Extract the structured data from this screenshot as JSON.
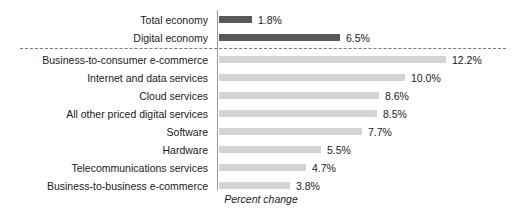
{
  "chart_data": {
    "type": "bar",
    "orientation": "horizontal",
    "title": "",
    "xlabel": "Percent change",
    "ylabel": "",
    "grid": false,
    "legend": null,
    "xlim": [
      0,
      13
    ],
    "value_suffix": "%",
    "categories": [
      "Total economy",
      "Digital economy",
      "Business-to-consumer e-commerce",
      "Internet and data services",
      "Cloud services",
      "All other priced digital services",
      "Software",
      "Hardware",
      "Telecommunications services",
      "Business-to-business e-commerce"
    ],
    "values": [
      1.8,
      6.5,
      12.2,
      10.0,
      8.6,
      8.5,
      7.7,
      5.5,
      4.7,
      3.8
    ],
    "value_labels": [
      "1.8%",
      "6.5%",
      "12.2%",
      "10.0%",
      "8.6%",
      "8.5%",
      "7.7%",
      "5.5%",
      "4.7%",
      "3.8%"
    ],
    "groups": [
      {
        "name": "summary",
        "style": "dark",
        "color": "#595959",
        "categories": [
          "Total economy",
          "Digital economy"
        ]
      },
      {
        "name": "components",
        "style": "light",
        "color": "#d4d4d4",
        "categories": [
          "Business-to-consumer e-commerce",
          "Internet and data services",
          "Cloud services",
          "All other priced digital services",
          "Software",
          "Hardware",
          "Telecommunications services",
          "Business-to-business e-commerce"
        ]
      }
    ],
    "annotations": [
      {
        "type": "dashed-separator",
        "after_category": "Digital economy",
        "color": "#7a7a7a"
      }
    ],
    "colors": {
      "dark_bar": "#595959",
      "light_bar": "#d4d4d4",
      "axis": "#9a9a9a",
      "text": "#1a1a1a",
      "background": "#ffffff"
    }
  }
}
